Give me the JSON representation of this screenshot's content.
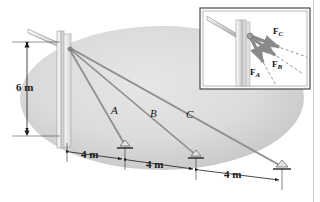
{
  "figure": {
    "type": "engineering-statics-free-body-diagram",
    "background_color": "#ffffff",
    "ground_fill": "#d9d9d9",
    "member_fill": "#c9c9c9",
    "cable_color": "#6e6e6e"
  },
  "main_diagram": {
    "height_dimension": {
      "label": "6 m",
      "value": 6,
      "unit": "m"
    },
    "ground_dimensions": [
      {
        "label": "4 m",
        "value": 4,
        "unit": "m"
      },
      {
        "label": "4 m",
        "value": 4,
        "unit": "m"
      },
      {
        "label": "4 m",
        "value": 4,
        "unit": "m"
      }
    ],
    "cable_labels": [
      {
        "label": "A",
        "anchor_distance_m": 4
      },
      {
        "label": "B",
        "anchor_distance_m": 8
      },
      {
        "label": "C",
        "anchor_distance_m": 12
      }
    ],
    "supports": [
      {
        "name": "anchor-a"
      },
      {
        "name": "anchor-b"
      },
      {
        "name": "anchor-c"
      }
    ]
  },
  "inset": {
    "border_color": "#4a4a4a",
    "forces": [
      {
        "label": "F",
        "subscript": "C",
        "name": "force-vector-c"
      },
      {
        "label": "F",
        "subscript": "B",
        "name": "force-vector-b"
      },
      {
        "label": "F",
        "subscript": "A",
        "name": "force-vector-a"
      }
    ]
  }
}
